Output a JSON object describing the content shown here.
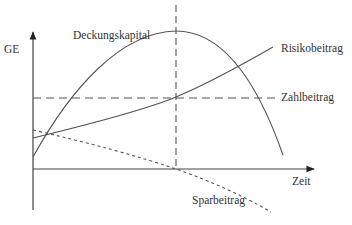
{
  "diagram": {
    "title": "",
    "axes": {
      "y_label": "GE",
      "x_label": "Zeit"
    },
    "curves": [
      {
        "id": "deckungskapital",
        "label": "Deckungskapital",
        "style": "solid"
      },
      {
        "id": "risikobeitrag",
        "label": "Risikobeitrag",
        "style": "solid"
      },
      {
        "id": "zahlbeitrag",
        "label": "Zahlbeitrag",
        "style": "dashed"
      },
      {
        "id": "sparbeitrag",
        "label": "Sparbeitrag",
        "style": "dotted"
      }
    ],
    "markers": [
      {
        "id": "peak-vertical",
        "style": "dashed",
        "note": "vertical line at Deckungskapital maximum"
      }
    ],
    "colors": {
      "line": "#555555",
      "text": "#333333",
      "background": "#ffffff"
    }
  }
}
